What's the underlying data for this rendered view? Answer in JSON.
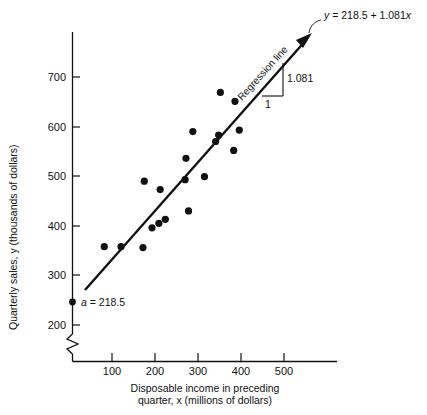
{
  "chart_data": {
    "type": "scatter",
    "title": "",
    "xlabel": "Disposable income in preceding quarter, x (millions of dollars)",
    "ylabel": "Quarterly sales, y (thousands of dollars)",
    "xlabel_line1": "Disposable income in preceding",
    "xlabel_line2": "quarter, x (millions of dollars)",
    "ylabel_text": "Quarterly sales, y (thousands of dollars)",
    "xticks": [
      100,
      200,
      300,
      400,
      500
    ],
    "xtick_labels": [
      "100",
      "200",
      "300",
      "400",
      "500"
    ],
    "yticks": [
      200,
      300,
      400,
      500,
      600,
      700
    ],
    "ytick_labels": [
      "200",
      "300",
      "400",
      "500",
      "600",
      "700"
    ],
    "xlim": [
      0,
      570
    ],
    "ylim": [
      180,
      760
    ],
    "grid": false,
    "axis_break_y": true,
    "legend": "none",
    "points": [
      {
        "x": 82,
        "y": 358
      },
      {
        "x": 121,
        "y": 358
      },
      {
        "x": 172,
        "y": 356
      },
      {
        "x": 175,
        "y": 490
      },
      {
        "x": 193,
        "y": 396
      },
      {
        "x": 209,
        "y": 405
      },
      {
        "x": 212,
        "y": 473
      },
      {
        "x": 224,
        "y": 413
      },
      {
        "x": 270,
        "y": 493
      },
      {
        "x": 272,
        "y": 536
      },
      {
        "x": 278,
        "y": 430
      },
      {
        "x": 288,
        "y": 590
      },
      {
        "x": 315,
        "y": 499
      },
      {
        "x": 341,
        "y": 570
      },
      {
        "x": 348,
        "y": 583
      },
      {
        "x": 352,
        "y": 669
      },
      {
        "x": 383,
        "y": 552
      },
      {
        "x": 386,
        "y": 651
      },
      {
        "x": 396,
        "y": 593
      }
    ],
    "regression": {
      "intercept": 218.5,
      "slope": 1.081,
      "equation": "y = 218.5 + 1.081x",
      "equation_lhs": "y",
      "equation_rhs_pre": " = 218.5 + 1.081",
      "equation_var": "x",
      "line_label": "Regression line",
      "slope_run_label": "1",
      "slope_rise_label": "1.081",
      "intercept_label_prefix": "a",
      "intercept_label_eq": " = 218.5",
      "intercept_label": "a = 218.5"
    }
  },
  "caption": {
    "text": ""
  }
}
